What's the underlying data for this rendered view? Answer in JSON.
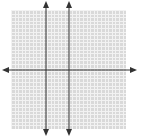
{
  "diagram": {
    "type": "coordinate-grid",
    "grid": {
      "left": 11,
      "top": 10,
      "width": 115,
      "height": 119,
      "cell_size": 3.6,
      "fill": "#d9d9d9",
      "line": "#f2f2f2"
    },
    "axes_color": "#333333",
    "horizontal_axis": {
      "y": 70,
      "x_start": 2,
      "x_end": 137,
      "arrows": "both"
    },
    "vertical_axes": [
      {
        "x": 46,
        "y_start": 1,
        "y_end": 136,
        "arrows": "both"
      },
      {
        "x": 69,
        "y_start": 1,
        "y_end": 136,
        "arrows": "both"
      }
    ]
  }
}
